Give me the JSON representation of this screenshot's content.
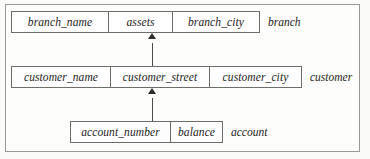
{
  "diagram": {
    "type": "relational-schema-diagram",
    "background_color": "#fbfbf8",
    "frame_color": "#9a9a94",
    "box_border_color": "#6e6e68",
    "arrow_color": "#2b2b28",
    "tables": [
      {
        "id": "branch",
        "name": "branch",
        "attributes": [
          {
            "label": "branch_name"
          },
          {
            "label": "assets"
          },
          {
            "label": "branch_city"
          }
        ]
      },
      {
        "id": "customer",
        "name": "customer",
        "attributes": [
          {
            "label": "customer_name"
          },
          {
            "label": "customer_street"
          },
          {
            "label": "customer_city"
          }
        ]
      },
      {
        "id": "account",
        "name": "account",
        "attributes": [
          {
            "label": "account_number"
          },
          {
            "label": "balance"
          }
        ]
      }
    ],
    "connectors": [
      {
        "id": "account-to-customer",
        "from": "account",
        "to": "customer",
        "direction": "up"
      },
      {
        "id": "customer-to-branch",
        "from": "customer",
        "to": "branch",
        "direction": "up"
      }
    ]
  }
}
